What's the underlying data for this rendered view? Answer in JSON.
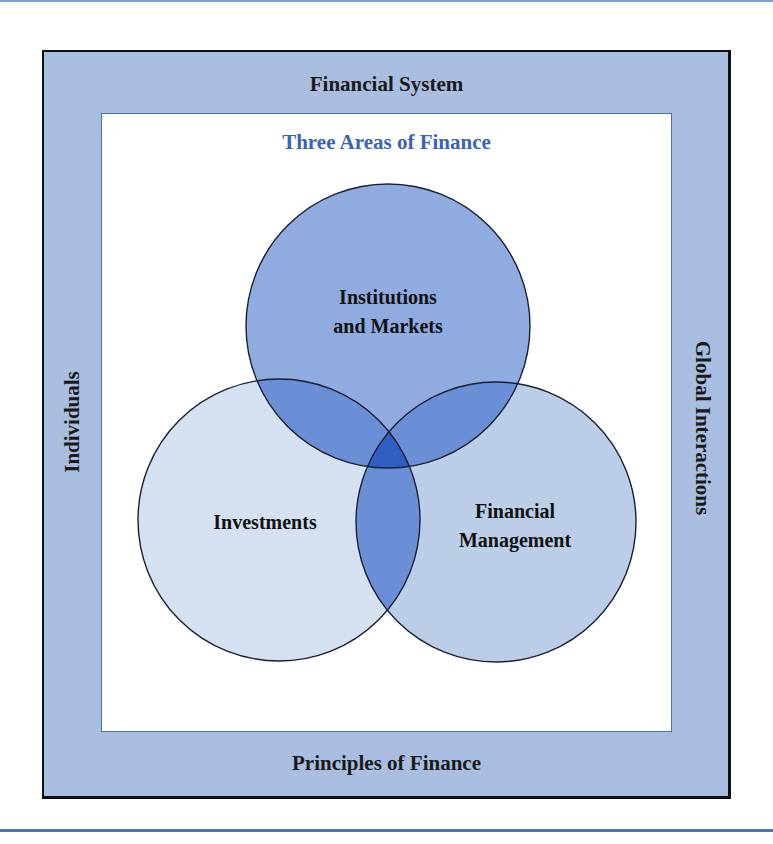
{
  "diagram": {
    "outer_frame": {
      "top_label": "Financial System",
      "bottom_label": "Principles of Finance",
      "left_label": "Individuals",
      "right_label": "Global Interactions"
    },
    "inner_box": {
      "title": "Three Areas of Finance"
    },
    "circles": [
      {
        "id": "institutions",
        "line1": "Institutions",
        "line2": "and Markets",
        "color": "#8fabe0"
      },
      {
        "id": "investments",
        "line1": "Investments",
        "color": "#d5e0f0"
      },
      {
        "id": "financial-management",
        "line1": "Financial",
        "line2": "Management",
        "color": "#bccde8"
      }
    ],
    "colors": {
      "frame_band": "#a9bde0",
      "frame_border": "#111111",
      "inner_border": "#4a6fb5",
      "title_blue": "#3a63b8",
      "pair_overlap": "#6a8fd6",
      "center_overlap": "#2f5fc0",
      "rule_blue": "#4a72c4"
    }
  }
}
